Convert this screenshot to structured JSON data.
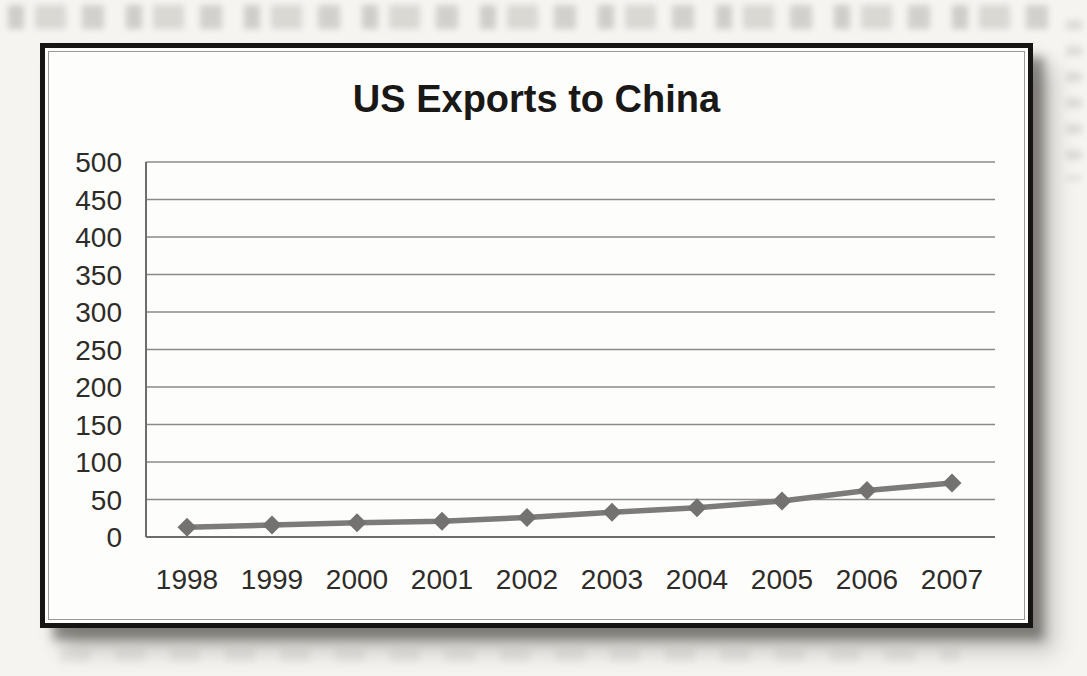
{
  "page": {
    "colors": {
      "page_background": "#f5f4f0",
      "frame_border": "#161514",
      "frame_inner_line": "#9b9a98",
      "chart_background": "#fdfdfb"
    }
  },
  "chart_data": {
    "type": "line",
    "title": "US Exports to China",
    "xlabel": "",
    "ylabel": "",
    "categories": [
      "1998",
      "1999",
      "2000",
      "2001",
      "2002",
      "2003",
      "2004",
      "2005",
      "2006",
      "2007"
    ],
    "series": [
      {
        "name": "US Exports to China",
        "values": [
          13,
          16,
          19,
          21,
          26,
          33,
          39,
          48,
          62,
          72
        ]
      }
    ],
    "ylim": [
      0,
      500
    ],
    "ytick_interval": 50,
    "yticks": [
      500,
      450,
      400,
      350,
      300,
      250,
      200,
      150,
      100,
      50,
      0
    ],
    "grid": true,
    "legend": "none",
    "marker": "diamond",
    "colors": {
      "line": "#7c7b79",
      "marker": "#737270",
      "grid": "#8b8a88",
      "axis": "#6e6d6b",
      "tick_text": "#2e2c29",
      "title_text": "#1a1817"
    }
  }
}
